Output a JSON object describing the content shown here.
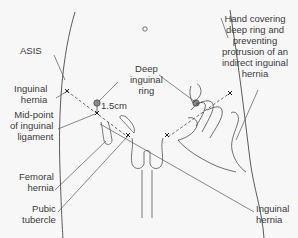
{
  "diagram": {
    "type": "anatomical-illustration",
    "colors": {
      "background": "#f7f7f7",
      "line": "#4a4a4a",
      "ring_fill": "#8a8a8a",
      "text": "#3a3a3a"
    },
    "labels": {
      "asis": "ASIS",
      "inguinal_hernia_left": [
        "Inguinal",
        "hernia"
      ],
      "midpoint": [
        "Mid-point",
        "of inguinal",
        "ligament"
      ],
      "femoral_hernia": [
        "Femoral",
        "hernia"
      ],
      "pubic_tubercle": [
        "Pubic",
        "tubercle"
      ],
      "deep_ring": [
        "Deep",
        "inguinal",
        "ring"
      ],
      "distance": "1.5cm",
      "hand_covering": [
        "Hand covering",
        "deep ring and",
        "preventing",
        "protrusion of an",
        "indirect inguinal",
        "hernia"
      ],
      "inguinal_hernia_right": [
        "Inguinal",
        "hernia"
      ]
    },
    "icons": {
      "umbilicus": "small-circle",
      "landmark_marker": "x-cross",
      "deep_ring_marker": "filled-circle"
    }
  }
}
